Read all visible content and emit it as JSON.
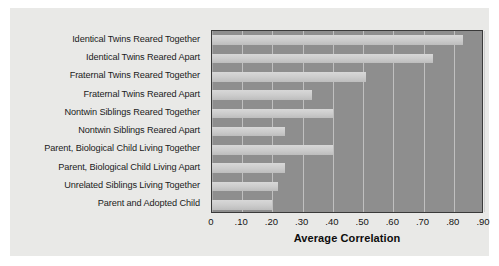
{
  "chart_data": {
    "type": "bar",
    "orientation": "horizontal",
    "title": "",
    "xlabel": "Average Correlation",
    "ylabel": "",
    "xlim": [
      0,
      0.9
    ],
    "grid": true,
    "legend": null,
    "xticks": [
      "0",
      ".10",
      ".20",
      ".30",
      ".40",
      ".50",
      ".60",
      ".70",
      ".80",
      ".90"
    ],
    "xtick_values": [
      0,
      0.1,
      0.2,
      0.3,
      0.4,
      0.5,
      0.6,
      0.7,
      0.8,
      0.9
    ],
    "categories": [
      "Identical Twins Reared Together",
      "Identical Twins Reared Apart",
      "Fraternal Twins Reared Together",
      "Fraternal Twins Reared Apart",
      "Nontwin Siblings Reared Together",
      "Nontwin Siblings Reared Apart",
      "Parent, Biological Child Living Together",
      "Parent, Biological Child Living Apart",
      "Unrelated Siblings Living Together",
      "Parent and Adopted Child"
    ],
    "values": [
      0.83,
      0.73,
      0.51,
      0.33,
      0.4,
      0.24,
      0.4,
      0.24,
      0.22,
      0.2
    ],
    "colors": {
      "bar": "#cfcfcf",
      "plot_background": "#8e8e8e",
      "panel_background": "#e9e9e7",
      "gridline": "#c9c9c9",
      "frame": "#3a3a3a",
      "text": "#1b1b1b"
    }
  }
}
